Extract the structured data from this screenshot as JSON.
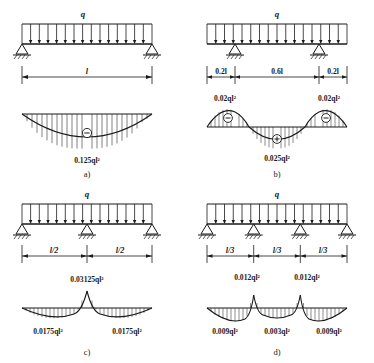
{
  "figure": {
    "load_symbol": "q",
    "sign_negative": "⊖",
    "sign_positive": "⊕"
  },
  "panels": [
    {
      "key": "a",
      "caption": "a)",
      "supports": [
        "pin",
        "roller"
      ],
      "load_label": "q",
      "spans": [
        {
          "label": "l"
        }
      ],
      "moments": [
        {
          "label": "0.125ql²",
          "sign": "⊖",
          "position": "midspan"
        }
      ]
    },
    {
      "key": "b",
      "caption": "b)",
      "supports": [
        "pin",
        "roller"
      ],
      "load_label": "q",
      "spans": [
        {
          "label": "0.2l"
        },
        {
          "label": "0.6l"
        },
        {
          "label": "0.2l"
        }
      ],
      "moments": [
        {
          "label": "0.02ql²",
          "sign": "⊖",
          "position": "left-support"
        },
        {
          "label": "0.02ql²",
          "sign": "⊖",
          "position": "right-support"
        },
        {
          "label": "0.025ql²",
          "sign": "⊕",
          "position": "midspan"
        }
      ]
    },
    {
      "key": "c",
      "caption": "c)",
      "supports": [
        "pin",
        "roller",
        "roller"
      ],
      "load_label": "q",
      "spans": [
        {
          "label": "l/2"
        },
        {
          "label": "l/2"
        }
      ],
      "moments": [
        {
          "label": "0.03125ql²",
          "sign": "",
          "position": "middle-support"
        },
        {
          "label": "0.0175ql²",
          "sign": "",
          "position": "left-span"
        },
        {
          "label": "0.0175ql²",
          "sign": "",
          "position": "right-span"
        }
      ]
    },
    {
      "key": "d",
      "caption": "d)",
      "supports": [
        "pin",
        "roller",
        "roller",
        "roller"
      ],
      "load_label": "q",
      "spans": [
        {
          "label": "l/3"
        },
        {
          "label": "l/3"
        },
        {
          "label": "l/3"
        }
      ],
      "moments": [
        {
          "label": "0.012ql²",
          "sign": "",
          "position": "support-2"
        },
        {
          "label": "0.012ql²",
          "sign": "",
          "position": "support-3"
        },
        {
          "label": "0.009ql²",
          "sign": "",
          "position": "left-span"
        },
        {
          "label": "0.003ql²",
          "sign": "",
          "position": "middle-span"
        },
        {
          "label": "0.009ql²",
          "sign": "",
          "position": "right-span"
        }
      ]
    }
  ]
}
